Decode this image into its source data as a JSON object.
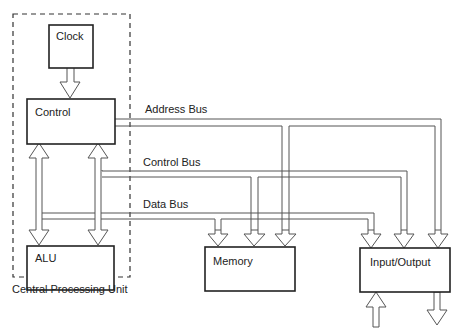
{
  "diagram": {
    "cpu_group": {
      "label": "Central Processing Unit"
    },
    "components": {
      "clock": {
        "label": "Clock"
      },
      "control": {
        "label": "Control"
      },
      "alu": {
        "label": "ALU"
      },
      "memory": {
        "label": "Memory"
      },
      "io": {
        "label": "Input/Output"
      }
    },
    "buses": {
      "address": {
        "label": "Address Bus"
      },
      "control": {
        "label": "Control Bus"
      },
      "data": {
        "label": "Data Bus"
      }
    },
    "colors": {
      "box_stroke": "#222222",
      "bus_stroke": "#555555",
      "background": "#ffffff"
    }
  }
}
